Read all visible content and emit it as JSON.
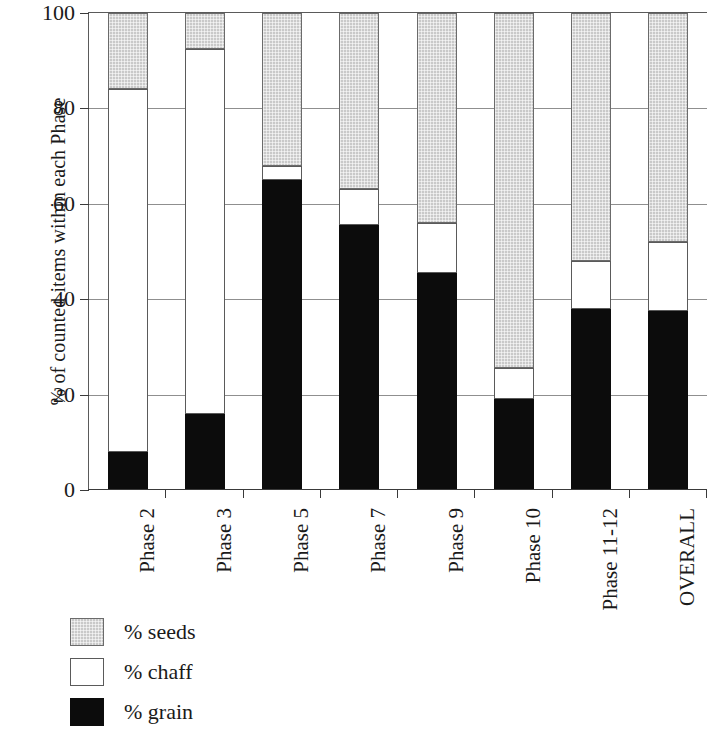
{
  "chart_data": {
    "type": "bar",
    "subtype": "stacked-bar-100",
    "title": "",
    "xlabel": "",
    "ylabel": "% of counted items within each Phase",
    "ylim": [
      0,
      100
    ],
    "yticks": [
      0,
      20,
      40,
      60,
      80,
      100
    ],
    "ytick_labels": [
      "0",
      "20",
      "40",
      "60",
      "80",
      "100"
    ],
    "grid": true,
    "grid_axis": "y",
    "legend_position": "below-left",
    "categories": [
      "Phase 2",
      "Phase 3",
      "Phase 5",
      "Phase 7",
      "Phase 9",
      "Phase 10",
      "Phase 11-12",
      "OVERALL"
    ],
    "series": [
      {
        "name": "% grain",
        "color": "#0c0c0c",
        "values": [
          8,
          16,
          65,
          55.5,
          45.5,
          19,
          38,
          37.5
        ]
      },
      {
        "name": "% chaff",
        "color": "#ffffff",
        "values": [
          76,
          76.5,
          3,
          7.5,
          10.5,
          6.5,
          10,
          14.5
        ]
      },
      {
        "name": "% seeds",
        "color": "#c9c9c9",
        "values": [
          16,
          7.5,
          32,
          37,
          44,
          74.5,
          52,
          48
        ]
      }
    ],
    "cumulative_tops": {
      "grain": [
        8,
        16,
        65,
        55.5,
        45.5,
        19,
        38,
        37.5
      ],
      "chaff": [
        84,
        92.5,
        68,
        63,
        56,
        25.5,
        48,
        52
      ],
      "seeds": [
        100,
        100,
        100,
        100,
        100,
        100,
        100,
        100
      ]
    }
  },
  "axis": {
    "y_title": "% of counted items within each Phase",
    "y_ticks": [
      {
        "value": 100,
        "label": "100"
      },
      {
        "value": 80,
        "label": "80"
      },
      {
        "value": 60,
        "label": "60"
      },
      {
        "value": 40,
        "label": "40"
      },
      {
        "value": 20,
        "label": "20"
      },
      {
        "value": 0,
        "label": "0"
      }
    ]
  },
  "x_labels": [
    {
      "label": "Phase 2"
    },
    {
      "label": "Phase 3"
    },
    {
      "label": "Phase 5"
    },
    {
      "label": "Phase 7"
    },
    {
      "label": "Phase 9"
    },
    {
      "label": "Phase 10"
    },
    {
      "label": "Phase 11-12"
    },
    {
      "label": "OVERALL"
    }
  ],
  "legend": {
    "items": [
      {
        "label": "% seeds",
        "swatch": "seeds",
        "color": "#c9c9c9"
      },
      {
        "label": "% chaff",
        "swatch": "chaff",
        "color": "#ffffff"
      },
      {
        "label": "% grain",
        "swatch": "grain",
        "color": "#0c0c0c"
      }
    ]
  }
}
